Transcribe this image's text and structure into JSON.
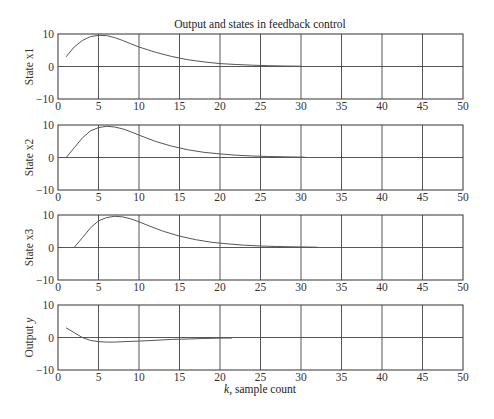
{
  "chart_data": {
    "type": "line",
    "title": "Output and states in feedback control",
    "xlabel": "k, sample count",
    "xlabel_italic_part": "k",
    "xlabel_rest": ", sample count",
    "xlim": [
      0,
      50
    ],
    "x_ticks": [
      0,
      5,
      10,
      15,
      20,
      25,
      30,
      35,
      40,
      45,
      50
    ],
    "grid": true,
    "panels": [
      {
        "ylabel": "State x1",
        "ylim": [
          -10,
          10
        ],
        "y_ticks": [
          -10,
          0,
          10
        ],
        "x": [
          1,
          2,
          3,
          4,
          5,
          6,
          7,
          8,
          9,
          10,
          12,
          14,
          16,
          18,
          20,
          22,
          24,
          26,
          28,
          30
        ],
        "values": [
          3.0,
          6.0,
          8.0,
          9.2,
          9.6,
          9.5,
          8.9,
          8.0,
          7.0,
          6.0,
          4.4,
          3.1,
          2.1,
          1.4,
          0.9,
          0.6,
          0.4,
          0.25,
          0.15,
          0.1
        ]
      },
      {
        "ylabel": "State x2",
        "ylim": [
          -10,
          10
        ],
        "y_ticks": [
          -10,
          0,
          10
        ],
        "x": [
          1,
          2,
          3,
          4,
          5,
          6,
          7,
          8,
          9,
          10,
          12,
          14,
          16,
          18,
          20,
          22,
          24,
          26,
          28,
          30.5
        ],
        "values": [
          0,
          3.0,
          6.0,
          8.2,
          9.2,
          9.6,
          9.4,
          8.8,
          7.9,
          6.9,
          5.0,
          3.5,
          2.4,
          1.6,
          1.1,
          0.7,
          0.45,
          0.3,
          0.2,
          0.1
        ]
      },
      {
        "ylabel": "State x3",
        "ylim": [
          -10,
          10
        ],
        "y_ticks": [
          -10,
          0,
          10
        ],
        "x": [
          2,
          3,
          4,
          5,
          6,
          7,
          8,
          9,
          10,
          11,
          13,
          15,
          17,
          19,
          21,
          23,
          25,
          27,
          29,
          32
        ],
        "values": [
          0,
          3.0,
          6.0,
          8.2,
          9.2,
          9.6,
          9.4,
          8.8,
          7.9,
          6.9,
          5.0,
          3.5,
          2.4,
          1.6,
          1.1,
          0.7,
          0.45,
          0.3,
          0.2,
          0.1
        ]
      },
      {
        "ylabel": "Output y",
        "ylabel_italic_part": "y",
        "ylabel_rest": "Output ",
        "ylim": [
          -10,
          10
        ],
        "y_ticks": [
          -10,
          0,
          10
        ],
        "x": [
          1,
          2,
          3,
          4,
          5,
          6,
          7,
          8,
          9,
          10,
          12,
          14,
          16,
          18,
          20,
          21.5
        ],
        "values": [
          3.0,
          1.5,
          0.0,
          -0.9,
          -1.3,
          -1.4,
          -1.4,
          -1.3,
          -1.2,
          -1.1,
          -0.85,
          -0.6,
          -0.45,
          -0.3,
          -0.2,
          -0.15
        ]
      }
    ]
  }
}
